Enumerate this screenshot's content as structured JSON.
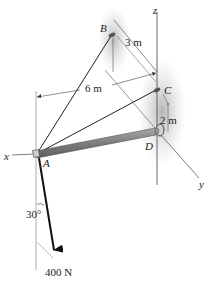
{
  "diagram": {
    "type": "statics-3d-boom",
    "points": {
      "A": {
        "label": "A"
      },
      "B": {
        "label": "B"
      },
      "C": {
        "label": "C"
      },
      "D": {
        "label": "D"
      }
    },
    "axes": {
      "x": {
        "label": "x"
      },
      "y": {
        "label": "y"
      },
      "z": {
        "label": "z"
      }
    },
    "dimensions": {
      "BC": "3 m",
      "A_to_wall": "6 m",
      "CD": "2 m"
    },
    "force": {
      "magnitude": "400 N",
      "angle": "30°"
    },
    "colors": {
      "line": "#222222",
      "boom": "#8a8a8a",
      "wall_shadow": "#bdbdbd",
      "background": "#ffffff"
    }
  }
}
